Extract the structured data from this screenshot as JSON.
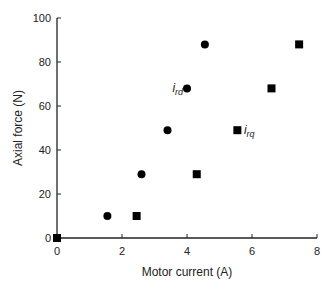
{
  "chart_data": {
    "type": "scatter",
    "title": "",
    "xlabel": "Motor current (A)",
    "ylabel": "Axial force (N)",
    "xlim": [
      0,
      8
    ],
    "ylim": [
      0,
      100
    ],
    "xticks": [
      0,
      2,
      4,
      6,
      8
    ],
    "yticks": [
      0,
      20,
      40,
      60,
      80,
      100
    ],
    "grid": false,
    "series": [
      {
        "name": "i_rd",
        "marker": "circle",
        "color": "#000000",
        "x": [
          1.55,
          2.6,
          3.4,
          4.0,
          4.55
        ],
        "y": [
          10,
          29,
          49,
          68,
          88
        ]
      },
      {
        "name": "i_rq",
        "marker": "square",
        "color": "#000000",
        "x": [
          0,
          2.45,
          4.3,
          5.55,
          6.6,
          7.45
        ],
        "y": [
          0,
          10,
          29,
          49,
          68,
          88
        ]
      }
    ],
    "annotations": [
      {
        "text_main": "i",
        "text_sub": "rd",
        "x": 3.55,
        "y": 68
      },
      {
        "text_main": "i",
        "text_sub": "rq",
        "x": 5.75,
        "y": 49
      }
    ]
  }
}
